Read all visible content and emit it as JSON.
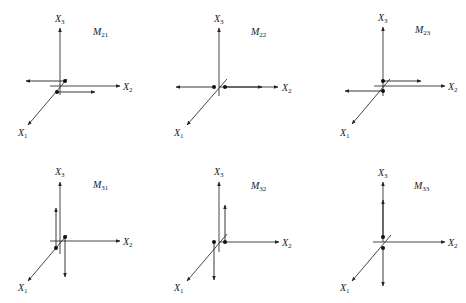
{
  "figure": {
    "panels": [
      {
        "id": "M21",
        "label": "M",
        "label_sub": "21",
        "ox": 60,
        "oy": 86,
        "axes": {
          "x1": "X",
          "x1_sub": "1",
          "x2": "X",
          "x2_sub": "2",
          "x3": "X",
          "x3_sub": "3"
        },
        "description": "Couple: two opposite forces parallel to X2, offset along X1"
      },
      {
        "id": "M22",
        "label": "M",
        "label_sub": "22",
        "ox": 219,
        "oy": 87,
        "axes": {
          "x1": "X",
          "x1_sub": "1",
          "x2": "X",
          "x2_sub": "2",
          "x3": "X",
          "x3_sub": "3"
        },
        "description": "Dipole: two opposite forces along X2, offset along X2"
      },
      {
        "id": "M23",
        "label": "M",
        "label_sub": "23",
        "ox": 383,
        "oy": 86,
        "axes": {
          "x1": "X",
          "x1_sub": "1",
          "x2": "X",
          "x2_sub": "2",
          "x3": "X",
          "x3_sub": "3"
        },
        "description": "Couple: two opposite forces parallel to X2, offset along X3"
      },
      {
        "id": "M31",
        "label": "M",
        "label_sub": "31",
        "ox": 60,
        "oy": 241,
        "axes": {
          "x1": "X",
          "x1_sub": "1",
          "x2": "X",
          "x2_sub": "2",
          "x3": "X",
          "x3_sub": "3"
        },
        "description": "Couple: two opposite forces parallel to X3, offset along X1"
      },
      {
        "id": "M32",
        "label": "M",
        "label_sub": "32",
        "ox": 219,
        "oy": 242,
        "axes": {
          "x1": "X",
          "x1_sub": "1",
          "x2": "X",
          "x2_sub": "2",
          "x3": "X",
          "x3_sub": "3"
        },
        "description": "Couple: two opposite forces parallel to X3, offset along X2"
      },
      {
        "id": "M33",
        "label": "M",
        "label_sub": "33",
        "ox": 383,
        "oy": 242,
        "axes": {
          "x1": "X",
          "x1_sub": "1",
          "x2": "X",
          "x2_sub": "2",
          "x3": "X",
          "x3_sub": "3"
        },
        "description": "Dipole: two opposite forces along X3, offset along X3"
      }
    ]
  }
}
